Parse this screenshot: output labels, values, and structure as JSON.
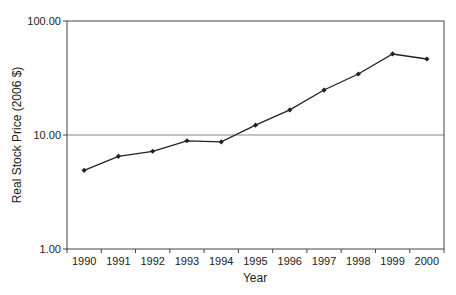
{
  "chart_data": {
    "type": "line",
    "title": "",
    "xlabel": "Year",
    "ylabel": "Real Stock Price (2006 $)",
    "yscale": "log",
    "ylim": [
      1,
      100
    ],
    "yticks": [
      1,
      10,
      100
    ],
    "ytick_labels": [
      "1.00",
      "10.00",
      "100.00"
    ],
    "grid": "horizontal major gridline at 10.00",
    "legend": "none",
    "categories": [
      "1990",
      "1991",
      "1992",
      "1993",
      "1994",
      "1995",
      "1996",
      "1997",
      "1998",
      "1999",
      "2000"
    ],
    "series": [
      {
        "name": "Real Stock Price",
        "values": [
          4.9,
          6.5,
          7.2,
          8.9,
          8.7,
          12.2,
          16.6,
          24.8,
          34.3,
          51.4,
          46.4
        ],
        "marker": "diamond",
        "color": "#222222"
      }
    ]
  },
  "colors": {
    "line": "#222222",
    "axis": "#444444",
    "gridline": "#888888"
  }
}
